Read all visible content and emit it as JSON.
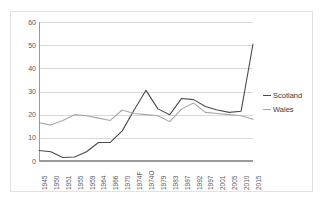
{
  "chart_data": {
    "type": "line",
    "title": "",
    "subtitle": "",
    "xlabel": "",
    "ylabel": "",
    "ylim": [
      0,
      60
    ],
    "ytick_labels": [
      "60",
      "50",
      "40",
      "30",
      "20",
      "10",
      "0"
    ],
    "ytick_values": [
      60,
      50,
      40,
      30,
      20,
      10,
      0
    ],
    "grid": true,
    "legend_position": "right",
    "categories": [
      "1945",
      "1950",
      "1951",
      "1955",
      "1959",
      "1964",
      "1966",
      "1970",
      "1974F",
      "1974O",
      "1979",
      "1983",
      "1987",
      "1992",
      "1997",
      "2001",
      "2005",
      "2010",
      "2015"
    ],
    "series": [
      {
        "name": "Scotland",
        "color": "#4a4a4a",
        "values": [
          4.5,
          4.0,
          1.5,
          1.7,
          4.0,
          8.0,
          8.0,
          13.0,
          22.0,
          30.5,
          22.5,
          20.0,
          27.0,
          26.5,
          23.5,
          22.0,
          21.0,
          21.5,
          50.5
        ]
      },
      {
        "name": "Wales",
        "color": "#a6a6a6",
        "values": [
          16.5,
          15.5,
          17.5,
          20.0,
          19.5,
          18.5,
          17.5,
          22.0,
          20.5,
          20.0,
          19.5,
          17.0,
          22.5,
          25.0,
          21.0,
          20.5,
          20.0,
          19.5,
          18.0
        ]
      }
    ]
  },
  "legend": {
    "items": [
      {
        "label": "Scotland",
        "color": "#4a4a4a"
      },
      {
        "label": "Wales",
        "color": "#a6a6a6"
      }
    ]
  }
}
